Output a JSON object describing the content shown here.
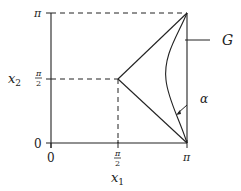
{
  "figure": {
    "type": "diagram",
    "axes": {
      "x_label_main": "x",
      "x_label_sub": "1",
      "y_label_main": "x",
      "y_label_sub": "2",
      "x_ticks": [
        {
          "label": "0"
        },
        {
          "label_num": "π",
          "label_den": "2"
        },
        {
          "label": "π"
        }
      ],
      "y_ticks": [
        {
          "label": "0"
        },
        {
          "label_num": "π",
          "label_den": "2"
        },
        {
          "label": "π"
        }
      ]
    },
    "annotations": {
      "curve_label": "G",
      "angle_label": "α"
    },
    "colors": {
      "ink": "#222222",
      "background": "#ffffff"
    }
  }
}
